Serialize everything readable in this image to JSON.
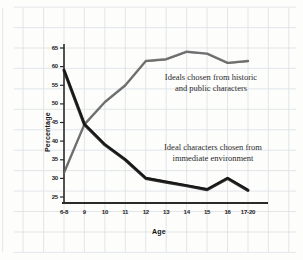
{
  "chart_data": {
    "type": "line",
    "title": "",
    "xlabel": "Age",
    "ylabel": "Percentage",
    "categories": [
      "6-8",
      "9",
      "10",
      "11",
      "12",
      "13",
      "14",
      "15",
      "16",
      "17-20"
    ],
    "ylim": [
      25,
      65
    ],
    "yticks": [
      25,
      30,
      35,
      40,
      45,
      50,
      55,
      60,
      65
    ],
    "grid": true,
    "legend": "annotations-on-plot",
    "series": [
      {
        "name": "Ideals chosen from historic and public characters",
        "color": "#555555",
        "values": [
          31.5,
          44.5,
          50.5,
          55.0,
          61.5,
          62.0,
          64.0,
          63.5,
          61.0,
          61.5
        ]
      },
      {
        "name": "Ideal characters chosen from immediate environment",
        "color": "#232323",
        "values": [
          59.0,
          44.5,
          39.0,
          35.0,
          30.0,
          29.0,
          28.0,
          27.0,
          30.0,
          26.8
        ]
      }
    ],
    "annotations": [
      {
        "id": "annotation-historic",
        "text": "Ideals chosen from historic\nand public characters"
      },
      {
        "id": "annotation-immediate",
        "text": "Ideal characters chosen from\nimmediate environment"
      }
    ]
  },
  "colors": {
    "grid": "#dfe3e6",
    "grid_minor": "#eceff1",
    "axis": "#2a2a2a",
    "text": "#1c1c1c",
    "background": "#fdfdfc",
    "series_historic": "#555555",
    "series_immediate": "#232323"
  }
}
